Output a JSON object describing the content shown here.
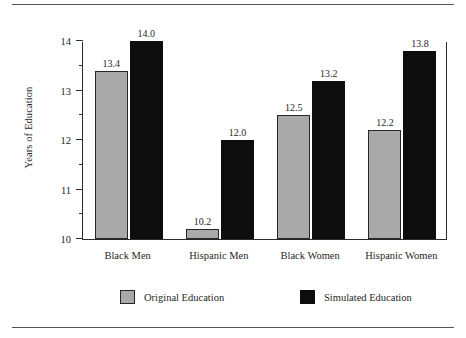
{
  "chart_data": {
    "type": "bar",
    "title": "",
    "xlabel": "",
    "ylabel": "Years of Education",
    "ylim": [
      10,
      14
    ],
    "yticks": [
      10,
      11,
      12,
      13,
      14
    ],
    "ytick_labels": [
      "10",
      "11",
      "12",
      "13",
      "14"
    ],
    "minor_ticks": [
      10.5,
      11.5,
      12.5,
      13.5
    ],
    "grid": false,
    "legend_position": "bottom",
    "categories": [
      "Black Men",
      "Hispanic Men",
      "Black Women",
      "Hispanic Women"
    ],
    "series": [
      {
        "name": "Original Education",
        "color": "#a9a9a9",
        "values": [
          13.4,
          10.2,
          12.5,
          12.2
        ],
        "labels": [
          "13.4",
          "10.2",
          "12.5",
          "12.2"
        ]
      },
      {
        "name": "Simulated Education",
        "color": "#0d0d0d",
        "values": [
          14.0,
          12.0,
          13.2,
          13.8
        ],
        "labels": [
          "14.0",
          "12.0",
          "13.2",
          "13.8"
        ]
      }
    ]
  },
  "legend": {
    "items": [
      {
        "label": "Original Education",
        "swatch": "original"
      },
      {
        "label": "Simulated Education",
        "swatch": "simulated"
      }
    ]
  },
  "colors": {
    "original": "#a9a9a9",
    "simulated": "#0d0d0d",
    "axis": "#2b2b2b",
    "text": "#1f1f1f",
    "rule": "#555555"
  }
}
